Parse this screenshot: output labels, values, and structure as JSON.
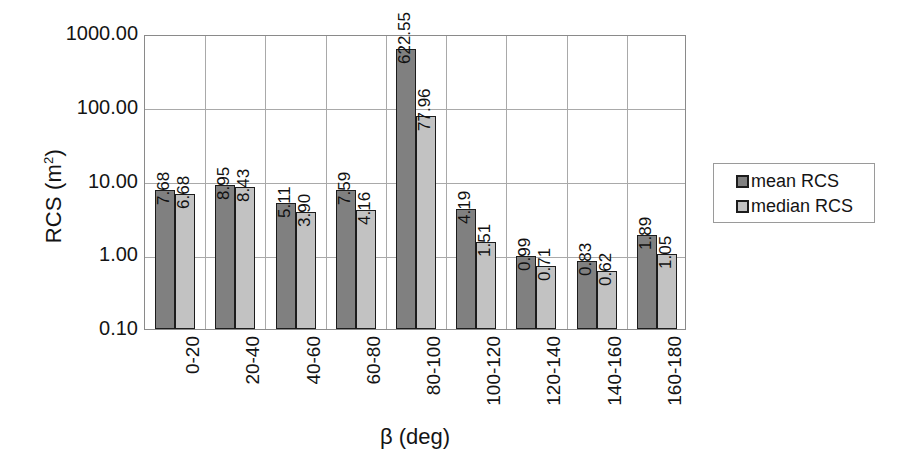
{
  "chart_data": {
    "type": "bar",
    "title": "",
    "xlabel": "β (deg)",
    "ylabel": "RCS (m²)",
    "ylabel_base": "RCS (m",
    "ylabel_sup": "2",
    "ylabel_tail": ")",
    "yscale": "log",
    "ylim": [
      0.1,
      1000
    ],
    "ytick_labels": [
      "1000.00",
      "100.00",
      "10.00",
      "1.00",
      "0.10"
    ],
    "ytick_values": [
      1000,
      100,
      10,
      1,
      0.1
    ],
    "grid": "horizontal-and-vertical",
    "legend_position": "right",
    "categories": [
      "0-20",
      "20-40",
      "40-60",
      "60-80",
      "80-100",
      "100-120",
      "120-140",
      "140-160",
      "160-180"
    ],
    "series": [
      {
        "name": "mean RCS",
        "color": "#808080",
        "values": [
          7.68,
          8.95,
          5.11,
          7.59,
          622.55,
          4.19,
          0.99,
          0.83,
          1.89
        ],
        "labels": [
          "7.68",
          "8.95",
          "5.11",
          "7.59",
          "622.55",
          "4.19",
          "0.99",
          "0.83",
          "1.89"
        ]
      },
      {
        "name": "median RCS",
        "color": "#c2c2c2",
        "values": [
          6.68,
          8.43,
          3.9,
          4.16,
          77.96,
          1.51,
          0.71,
          0.62,
          1.05
        ],
        "labels": [
          "6.68",
          "8.43",
          "3.90",
          "4.16",
          "77.96",
          "1.51",
          "0.71",
          "0.62",
          "1.05"
        ]
      }
    ]
  },
  "legend": {
    "items": [
      {
        "label": "mean RCS",
        "swatch": "mean"
      },
      {
        "label": "median RCS",
        "swatch": "median"
      }
    ]
  },
  "colors": {
    "mean_bar": "#808080",
    "median_bar": "#c2c2c2",
    "bar_outline": "#1c1c1c",
    "gridline": "#a9a9a9",
    "plot_border": "#8a8a8a",
    "text": "#141414",
    "background": "#ffffff"
  }
}
